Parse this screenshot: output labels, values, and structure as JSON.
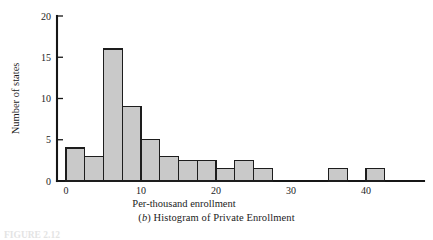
{
  "figure": {
    "caption_prefix": "(",
    "caption_letter": "b",
    "caption_suffix": ") Histogram of Private Enrollment",
    "footer_label": "FIGURE 2.12",
    "background_color": "#ffffff"
  },
  "axes": {
    "x_title": "Per-thousand enrollment",
    "y_title": "Number of states",
    "x_ticks": [
      "0",
      "10",
      "20",
      "30",
      "40"
    ],
    "y_ticks": [
      "0",
      "5",
      "10",
      "15",
      "20"
    ],
    "axis_color": "#161616"
  },
  "chart_data": {
    "type": "bar",
    "title": "(b) Histogram of Private Enrollment",
    "xlabel": "Per-thousand enrollment",
    "ylabel": "Number of states",
    "xlim": [
      -2.5,
      45
    ],
    "ylim": [
      0,
      20
    ],
    "grid": false,
    "legend": null,
    "bin_width": 2.5,
    "bar_fill": "#c9c9c9",
    "bar_edge": "#1d1d1d",
    "bins": [
      {
        "start": 0,
        "end": 2.5,
        "value": 4
      },
      {
        "start": 2.5,
        "end": 5,
        "value": 3
      },
      {
        "start": 5,
        "end": 7.5,
        "value": 16
      },
      {
        "start": 7.5,
        "end": 10,
        "value": 9
      },
      {
        "start": 10,
        "end": 12.5,
        "value": 5
      },
      {
        "start": 12.5,
        "end": 15,
        "value": 3
      },
      {
        "start": 15,
        "end": 17.5,
        "value": 2.5
      },
      {
        "start": 17.5,
        "end": 20,
        "value": 2.5
      },
      {
        "start": 20,
        "end": 22.5,
        "value": 1.5
      },
      {
        "start": 22.5,
        "end": 25,
        "value": 2.5
      },
      {
        "start": 25,
        "end": 27.5,
        "value": 1.5
      },
      {
        "start": 35,
        "end": 37.5,
        "value": 1.5
      },
      {
        "start": 40,
        "end": 42.5,
        "value": 1.5
      }
    ],
    "categories": [
      "0-2.5",
      "2.5-5",
      "5-7.5",
      "7.5-10",
      "10-12.5",
      "12.5-15",
      "15-17.5",
      "17.5-20",
      "20-22.5",
      "22.5-25",
      "25-27.5",
      "35-37.5",
      "40-42.5"
    ],
    "values": [
      4,
      3,
      16,
      9,
      5,
      3,
      2.5,
      2.5,
      1.5,
      2.5,
      1.5,
      1.5,
      1.5
    ]
  }
}
